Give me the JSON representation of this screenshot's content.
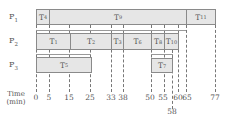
{
  "diagram": {
    "title": "",
    "processors": [
      {
        "label": "P",
        "sub": "1",
        "tasks": [
          {
            "label": "T",
            "sub": "4",
            "start": 0,
            "end": 5
          },
          {
            "label": "T",
            "sub": "9",
            "start": 5,
            "end": 65
          },
          {
            "label": "T",
            "sub": "11",
            "start": 65,
            "end": 77
          }
        ]
      },
      {
        "label": "P",
        "sub": "2",
        "tasks": [
          {
            "label": "T",
            "sub": "1",
            "start": 0,
            "end": 15
          },
          {
            "label": "T",
            "sub": "2",
            "start": 15,
            "end": 33
          },
          {
            "label": "T",
            "sub": "3",
            "start": 33,
            "end": 38
          },
          {
            "label": "T",
            "sub": "6",
            "start": 38,
            "end": 50
          },
          {
            "label": "T",
            "sub": "8",
            "start": 50,
            "end": 55
          },
          {
            "label": "T",
            "sub": "10",
            "start": 55,
            "end": 60
          }
        ]
      },
      {
        "label": "P",
        "sub": "3",
        "tasks": [
          {
            "label": "T",
            "sub": "5",
            "start": 0,
            "end": 25
          },
          {
            "label": "T",
            "sub": "7",
            "start": 50,
            "end": 58
          }
        ]
      }
    ],
    "axis": {
      "title_line1": "Time",
      "title_line2": "(min)",
      "ticks": [
        "0",
        "5",
        "15",
        "25",
        "33",
        "38",
        "50",
        "55",
        "58",
        "60",
        "65",
        "77"
      ]
    },
    "colors": {
      "bar_fill": "#e6e6e6",
      "bar_border": "#8a8a8a",
      "text": "#555555"
    }
  }
}
